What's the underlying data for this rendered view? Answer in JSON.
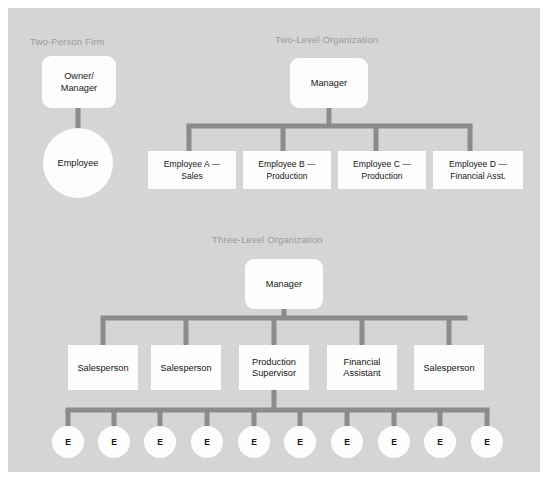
{
  "canvas": {
    "background_color": "#d5d5d5",
    "page_background_color": "#ffffff",
    "connector_color": "#8b8b8b",
    "node_fill_color": "#fdfdfd",
    "title_color": "#9a9a9a",
    "label_color": "#161616"
  },
  "diagram": {
    "type": "organizational-chart-set",
    "sections": [
      {
        "id": "two-person-firm",
        "title": "Two-Person Firm",
        "title_x": 30,
        "title_y": 45,
        "nodes": [
          {
            "id": "owner-manager",
            "shape": "rounded-rect",
            "lines": [
              "Owner/",
              "Manager"
            ],
            "x": 42,
            "y": 56,
            "w": 74,
            "h": 52,
            "rx": 9
          },
          {
            "id": "employee-circle",
            "shape": "circle",
            "lines": [
              "Employee"
            ],
            "cx": 78,
            "cy": 163,
            "r": 35
          }
        ],
        "connectors": [
          {
            "id": "owner-to-employee",
            "type": "vertical",
            "x": 78,
            "y1": 108,
            "y2": 130,
            "width": 5
          }
        ]
      },
      {
        "id": "two-level-organization",
        "title": "Two-Level Organization",
        "title_x": 275,
        "title_y": 43,
        "nodes": [
          {
            "id": "manager-two-level",
            "shape": "rounded-rect",
            "lines": [
              "Manager"
            ],
            "x": 290,
            "y": 58,
            "w": 78,
            "h": 50,
            "rx": 9
          },
          {
            "id": "employee-a",
            "shape": "rect",
            "lines": [
              "Employee A —",
              "Sales"
            ],
            "x": 148,
            "y": 151,
            "w": 88,
            "h": 38
          },
          {
            "id": "employee-b",
            "shape": "rect",
            "lines": [
              "Employee B —",
              "Production"
            ],
            "x": 243,
            "y": 151,
            "w": 88,
            "h": 38
          },
          {
            "id": "employee-c",
            "shape": "rect",
            "lines": [
              "Employee C —",
              "Production"
            ],
            "x": 338,
            "y": 151,
            "w": 88,
            "h": 38
          },
          {
            "id": "employee-d",
            "shape": "rect",
            "lines": [
              "Employee D —",
              "Financial Asst."
            ],
            "x": 433,
            "y": 151,
            "w": 90,
            "h": 38
          }
        ],
        "connectors": [
          {
            "id": "manager-stem",
            "type": "vertical",
            "x": 329,
            "y1": 108,
            "y2": 126,
            "width": 5
          },
          {
            "id": "manager-bus",
            "type": "horizontal",
            "x1": 189,
            "x2": 470,
            "y": 126,
            "width": 5
          },
          {
            "id": "drop-a",
            "type": "vertical",
            "x": 189,
            "y1": 126,
            "y2": 151,
            "width": 5
          },
          {
            "id": "drop-b",
            "type": "vertical",
            "x": 283,
            "y1": 126,
            "y2": 151,
            "width": 5
          },
          {
            "id": "drop-c",
            "type": "vertical",
            "x": 376,
            "y1": 126,
            "y2": 151,
            "width": 5
          },
          {
            "id": "drop-d",
            "type": "vertical",
            "x": 470,
            "y1": 126,
            "y2": 151,
            "width": 5
          }
        ]
      },
      {
        "id": "three-level-organization",
        "title": "Three-Level Organization",
        "title_x": 212,
        "title_y": 243,
        "nodes": [
          {
            "id": "manager-three-level",
            "shape": "rounded-rect",
            "lines": [
              "Manager"
            ],
            "x": 245,
            "y": 259,
            "w": 78,
            "h": 50,
            "rx": 9
          },
          {
            "id": "salesperson-1",
            "shape": "rect",
            "lines": [
              "Salesperson"
            ],
            "x": 68,
            "y": 345,
            "w": 70,
            "h": 45
          },
          {
            "id": "salesperson-2",
            "shape": "rect",
            "lines": [
              "Salesperson"
            ],
            "x": 151,
            "y": 345,
            "w": 70,
            "h": 45
          },
          {
            "id": "production-supervisor",
            "shape": "rect",
            "lines": [
              "Production",
              "Supervisor"
            ],
            "x": 239,
            "y": 345,
            "w": 70,
            "h": 45
          },
          {
            "id": "financial-assistant",
            "shape": "rect",
            "lines": [
              "Financial",
              "Assistant"
            ],
            "x": 327,
            "y": 345,
            "w": 70,
            "h": 45
          },
          {
            "id": "salesperson-3",
            "shape": "rect",
            "lines": [
              "Salesperson"
            ],
            "x": 414,
            "y": 345,
            "w": 70,
            "h": 45
          }
        ],
        "connectors": [
          {
            "id": "mgr3-stem",
            "type": "vertical",
            "x": 284,
            "y1": 309,
            "y2": 318,
            "width": 5
          },
          {
            "id": "mgr3-bus",
            "type": "horizontal",
            "x1": 103,
            "x2": 465,
            "y": 318,
            "width": 5
          },
          {
            "id": "drop-s1",
            "type": "vertical",
            "x": 103,
            "y1": 318,
            "y2": 345,
            "width": 5
          },
          {
            "id": "drop-s2",
            "type": "vertical",
            "x": 186,
            "y1": 318,
            "y2": 345,
            "width": 5
          },
          {
            "id": "drop-ps",
            "type": "vertical",
            "x": 274,
            "y1": 318,
            "y2": 345,
            "width": 5
          },
          {
            "id": "drop-fa",
            "type": "vertical",
            "x": 362,
            "y1": 318,
            "y2": 345,
            "width": 5
          },
          {
            "id": "drop-s3",
            "type": "vertical",
            "x": 449,
            "y1": 318,
            "y2": 345,
            "width": 5
          },
          {
            "id": "ps-stem",
            "type": "vertical",
            "x": 274,
            "y1": 390,
            "y2": 410,
            "width": 5
          },
          {
            "id": "leaf-bus",
            "type": "horizontal",
            "x1": 68,
            "x2": 487,
            "y": 410,
            "width": 5
          }
        ],
        "leaf_row": {
          "label": "E",
          "count": 10,
          "radius": 16,
          "cy": 442,
          "stem_top": 410,
          "stem_width": 5,
          "centers": [
            68,
            114,
            160,
            207,
            254,
            300,
            347,
            394,
            440,
            487
          ]
        }
      }
    ]
  }
}
